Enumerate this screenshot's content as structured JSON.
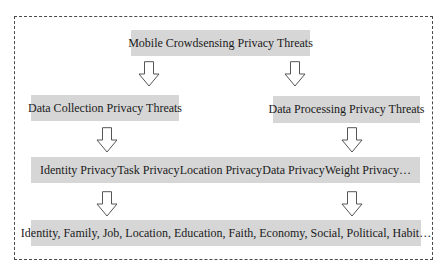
{
  "diagram": {
    "root": {
      "label": "Mobile Crowdsensing Privacy Threats"
    },
    "branches": [
      {
        "label": "Data Collection Privacy Threats"
      },
      {
        "label": "Data Processing Privacy Threats"
      }
    ],
    "privacy_types": {
      "items": [
        "Identity Privacy",
        "Task Privacy",
        "Location Privacy",
        "Data Privacy",
        "Weight Privacy…"
      ]
    },
    "attributes": {
      "label": "Identity, Family, Job, Location, Education, Faith, Economy, Social, Political, Habit…"
    },
    "colors": {
      "box_fill": "#d6d6d6",
      "border": "#4a4a4a",
      "arrow_stroke": "#555555"
    }
  }
}
